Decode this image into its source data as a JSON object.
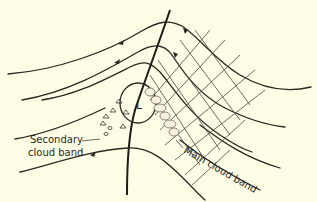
{
  "diagram": {
    "labels": {
      "secondary_line1": "Secondary",
      "secondary_line2": "cloud band",
      "main": "Main cloud band",
      "low": "L"
    },
    "colors": {
      "background": "#fefee6",
      "ink": "#2a2622"
    }
  }
}
